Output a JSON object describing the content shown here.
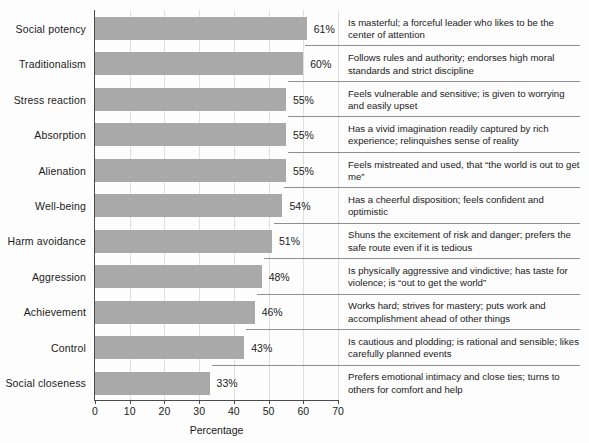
{
  "chart_data": {
    "type": "bar",
    "orientation": "horizontal",
    "title": "",
    "xlabel": "Percentage",
    "ylabel": "",
    "xlim": [
      0,
      70
    ],
    "xticks": [
      0,
      10,
      20,
      30,
      40,
      50,
      60,
      70
    ],
    "grid": true,
    "legend": null,
    "bar_color": "#a9a9a9",
    "categories": [
      "Social potency",
      "Traditionalism",
      "Stress reaction",
      "Absorption",
      "Alienation",
      "Well-being",
      "Harm avoidance",
      "Aggression",
      "Achievement",
      "Control",
      "Social closeness"
    ],
    "values": [
      61,
      60,
      55,
      55,
      55,
      54,
      51,
      48,
      46,
      43,
      33
    ],
    "value_labels": [
      "61%",
      "60%",
      "55%",
      "55%",
      "55%",
      "54%",
      "51%",
      "48%",
      "46%",
      "43%",
      "33%"
    ],
    "annotations": [
      "Is masterful; a forceful leader who likes to be the center of attention",
      "Follows rules and authority; endorses high moral standards and strict discipline",
      "Feels vulnerable and sensitive; is given to worrying and easily upset",
      "Has a vivid imagination readily captured by rich experience; relinquishes sense of reality",
      "Feels mistreated and used, that “the world is out to get me”",
      "Has a cheerful disposition; feels confident and optimistic",
      "Shuns the excitement of risk and danger; prefers the safe route even if it is tedious",
      "Is physically aggressive and vindictive; has taste for violence; is “out to get the world”",
      "Works hard; strives for mastery; puts work and accomplishment ahead of other things",
      "Is cautious and plodding; is rational and sensible; likes carefully planned events",
      "Prefers emotional intimacy and close ties; turns to others for comfort and help"
    ]
  }
}
